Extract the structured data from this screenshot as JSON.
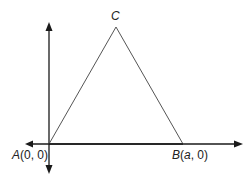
{
  "diagram": {
    "colors": {
      "axis": "#1a1a1a",
      "triangle": "#555555",
      "text": "#222222",
      "background": "#ffffff"
    },
    "axes": {
      "origin": {
        "x": 49,
        "y": 144
      },
      "x_axis": {
        "from": 25,
        "to": 243,
        "arrows": [
          "left",
          "right"
        ]
      },
      "y_axis": {
        "from": 22,
        "to": 174,
        "arrows": [
          "up",
          "down"
        ]
      }
    },
    "points": {
      "A": {
        "name": "A",
        "coords": "(0, 0)",
        "px": 49,
        "py": 144
      },
      "B": {
        "name": "B",
        "coords_prefix": "(",
        "param": "a",
        "coords_suffix": ", 0)",
        "px": 183,
        "py": 144
      },
      "C": {
        "name": "C",
        "px": 116,
        "py": 27
      }
    },
    "edges": [
      [
        "A",
        "B"
      ],
      [
        "B",
        "C"
      ],
      [
        "C",
        "A"
      ]
    ]
  }
}
